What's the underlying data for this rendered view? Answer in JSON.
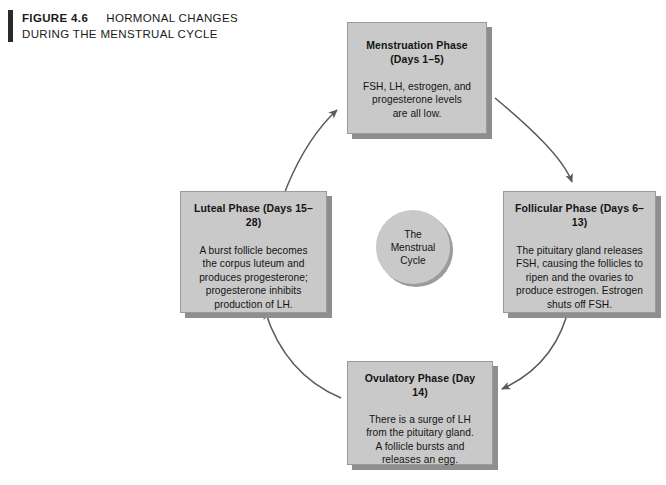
{
  "figure": {
    "label": "FIGURE 4.6",
    "title_line1": "HORMONAL CHANGES",
    "title_line2": "DURING THE MENSTRUAL CYCLE"
  },
  "center": {
    "label": "The\nMenstrual\nCycle"
  },
  "colors": {
    "box_fill": "#c9c9c9",
    "box_border": "#9a9a9a",
    "box_shadow": "#8e8e8e",
    "arrow": "#5a5a5a",
    "text": "#141414",
    "caption_rule": "#2a2a2a",
    "background": "#ffffff"
  },
  "phases": [
    {
      "id": "menstruation",
      "title": "Menstruation Phase\n(Days 1–5)",
      "body": "FSH, LH, estrogen, and\nprogesterone levels\nare all low."
    },
    {
      "id": "follicular",
      "title": "Follicular Phase (Days 6–13)",
      "body": "The pituitary gland releases\nFSH, causing the follicles to\nripen and the ovaries to\nproduce estrogen. Estrogen\nshuts off FSH."
    },
    {
      "id": "ovulatory",
      "title": "Ovulatory Phase (Day 14)",
      "body": "There is a surge of LH\nfrom the pituitary gland.\nA follicle bursts and\nreleases an egg."
    },
    {
      "id": "luteal",
      "title": "Luteal Phase (Days 15–28)",
      "body": "A burst follicle becomes\nthe corpus luteum and\nproduces progesterone;\nprogesterone inhibits\nproduction of LH."
    }
  ],
  "flow": {
    "arrows": [
      {
        "from": "luteal",
        "to": "menstruation"
      },
      {
        "from": "menstruation",
        "to": "follicular"
      },
      {
        "from": "follicular",
        "to": "ovulatory"
      },
      {
        "from": "ovulatory",
        "to": "luteal"
      }
    ]
  }
}
